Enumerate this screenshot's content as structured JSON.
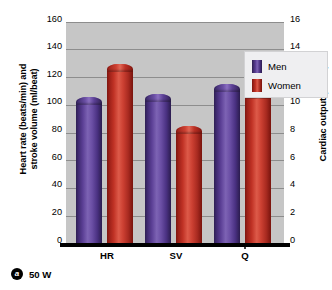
{
  "chart_data": {
    "type": "bar",
    "title": "",
    "subtitle": "",
    "categories": [
      "HR",
      "SV",
      "Q"
    ],
    "category_display": [
      "HR",
      "SV",
      "Q̇"
    ],
    "series": [
      {
        "name": "Men",
        "color": "#5b3f95",
        "values": [
          106,
          108,
          115
        ]
      },
      {
        "name": "Women",
        "color": "#c03225",
        "values": [
          130,
          85,
          110
        ]
      }
    ],
    "ylabel": "Heart rate (beats/min) and\nstroke volume (ml/beat)",
    "ylabel_right": "Cardiac output (L/min)",
    "xlabel": "",
    "ylim": [
      0,
      160
    ],
    "ylim_right": [
      0,
      16
    ],
    "yticks": [
      0,
      20,
      40,
      60,
      80,
      100,
      120,
      140,
      160
    ],
    "yticks_right": [
      0,
      2,
      4,
      6,
      8,
      10,
      12,
      14,
      16
    ],
    "grid": true,
    "legend_position": "upper right",
    "legend_entries": [
      "Men",
      "Women"
    ],
    "note": "Q series values are read on the right axis in L/min (Men 11.5, Women 11.0); HR and SV are read on the left axis.",
    "plot_background": "#c6c6c6",
    "gridline_color": "#8d8d8d"
  },
  "axes": {
    "left_title": "Heart rate (beats/min) and\nstroke volume (ml/beat)",
    "right_title": "Cardiac output (L/min)",
    "left_ticks": [
      "160",
      "140",
      "120",
      "100",
      "80",
      "60",
      "40",
      "20",
      "0"
    ],
    "right_ticks": [
      "16",
      "14",
      "12",
      "10",
      "8",
      "6",
      "4",
      "2",
      "0"
    ]
  },
  "legend": {
    "items": [
      {
        "label": "Men",
        "swatch": "men-swatch"
      },
      {
        "label": "Women",
        "swatch": "women-swatch"
      }
    ]
  },
  "caption": {
    "badge": "a",
    "text": "50 W"
  }
}
